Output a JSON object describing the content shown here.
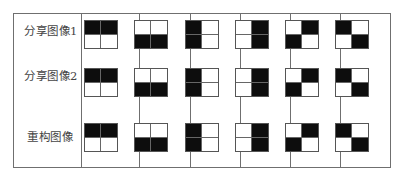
{
  "rows": [
    {
      "label": "分享图像1",
      "patterns": [
        [
          1,
          1,
          0,
          0
        ],
        [
          0,
          0,
          1,
          1
        ],
        [
          1,
          0,
          1,
          0
        ],
        [
          0,
          1,
          0,
          1
        ],
        [
          0,
          1,
          1,
          0
        ],
        [
          1,
          0,
          0,
          1
        ]
      ]
    },
    {
      "label": "分享图像2",
      "patterns": [
        [
          1,
          1,
          0,
          0
        ],
        [
          0,
          0,
          1,
          1
        ],
        [
          1,
          0,
          1,
          0
        ],
        [
          0,
          1,
          0,
          1
        ],
        [
          0,
          1,
          1,
          0
        ],
        [
          1,
          0,
          0,
          1
        ]
      ]
    },
    {
      "label": "重构图像",
      "patterns": [
        [
          1,
          1,
          0,
          0
        ],
        [
          0,
          0,
          1,
          1
        ],
        [
          1,
          0,
          1,
          0
        ],
        [
          0,
          1,
          0,
          1
        ],
        [
          0,
          1,
          1,
          0
        ],
        [
          1,
          0,
          0,
          1
        ]
      ]
    }
  ],
  "legend": {
    "black": "#0d0d0d",
    "white": "#ffffff",
    "border": "#6f6f6f"
  }
}
